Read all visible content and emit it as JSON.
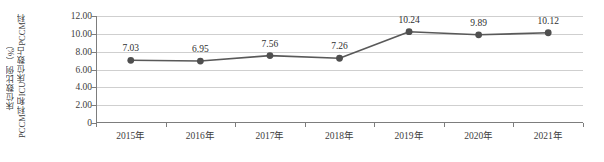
{
  "chart_data": {
    "type": "line",
    "title": "",
    "xlabel": "",
    "ylabel": "PCCM科和ICU床位数占PCCM科床位数比例（%）",
    "ylabel_lines": [
      "PCCM科和ICU床位数占PCCM科",
      "床位数比例（%）"
    ],
    "categories": [
      "2015年",
      "2016年",
      "2017年",
      "2018年",
      "2019年",
      "2020年",
      "2021年"
    ],
    "values": [
      7.03,
      6.95,
      7.56,
      7.26,
      10.24,
      9.89,
      10.12
    ],
    "data_labels": [
      "7.03",
      "6.95",
      "7.56",
      "7.26",
      "10.24",
      "9.89",
      "10.12"
    ],
    "ylim": [
      0,
      12
    ],
    "ytick_values": [
      0,
      2,
      4,
      6,
      8,
      10,
      12
    ],
    "ytick_labels": [
      "0",
      "2.00",
      "4.00",
      "6.00",
      "8.00",
      "10.00",
      "12.00"
    ],
    "grid": true,
    "grid_axis": "y",
    "legend": false,
    "series_name": "PCCM科和ICU床位数占PCCM科床位数比例",
    "marker": "circle",
    "colors": {
      "line": "#595959",
      "marker": "#4f4f4f",
      "grid": "#cfcfcf",
      "axis": "#7d7d7d",
      "text": "#3d3d3d",
      "background": "#ffffff"
    }
  }
}
